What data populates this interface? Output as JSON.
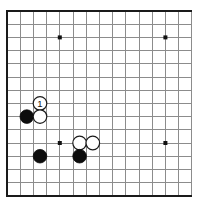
{
  "board": {
    "kind": "go-board-diagram",
    "title": "Go board corner diagram",
    "grid": {
      "columns": 15,
      "rows": 15,
      "spacing_px": 13.2,
      "origin_x_px": 7,
      "origin_y_px": 11,
      "line_color": "#8c8c8c",
      "edge_color": "#1a1a1a",
      "background_color": "#ffffff",
      "edges_drawn": [
        "left",
        "top",
        "bottom"
      ]
    },
    "star_points": [
      {
        "name": "star-point-upper-left",
        "col": 4,
        "row": 2
      },
      {
        "name": "star-point-upper-right",
        "col": 12,
        "row": 2
      },
      {
        "name": "star-point-center-left",
        "col": 4,
        "row": 10
      },
      {
        "name": "star-point-center-right",
        "col": 12,
        "row": 10
      }
    ],
    "stone_radius_px": 6.8,
    "stones": [
      {
        "name": "white-stone-move-1",
        "color": "white",
        "col": 2.5,
        "row": 7,
        "label": "1"
      },
      {
        "name": "black-stone-left-upper",
        "color": "black",
        "col": 1.5,
        "row": 8,
        "label": ""
      },
      {
        "name": "white-stone-left-lower",
        "color": "white",
        "col": 2.5,
        "row": 8,
        "label": ""
      },
      {
        "name": "black-stone-lower-left",
        "color": "black",
        "col": 2.5,
        "row": 11,
        "label": ""
      },
      {
        "name": "white-stone-center-a",
        "color": "white",
        "col": 5.5,
        "row": 10,
        "label": ""
      },
      {
        "name": "white-stone-center-b",
        "color": "white",
        "col": 6.5,
        "row": 10,
        "label": ""
      },
      {
        "name": "black-stone-lower-center",
        "color": "black",
        "col": 5.5,
        "row": 11,
        "label": ""
      }
    ],
    "move_number": "1"
  }
}
